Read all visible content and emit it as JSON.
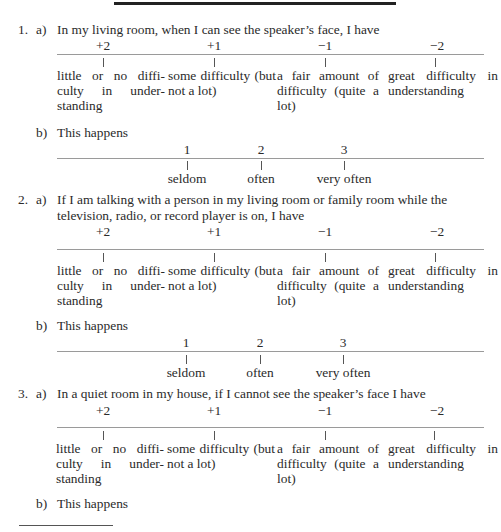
{
  "difficulty_scale": {
    "values": [
      "+2",
      "+1",
      "−1",
      "−2"
    ],
    "labels": [
      "little or no diffi- culty in under- standing",
      "some difficulty (but not a lot)",
      "a fair amount of difficulty (quite a lot)",
      "great difficulty in understanding"
    ]
  },
  "frequency_scale": {
    "values": [
      "1",
      "2",
      "3"
    ],
    "labels": [
      "seldom",
      "often",
      "very often"
    ]
  },
  "items": [
    {
      "number": "1.",
      "part_a_marker": "a)",
      "part_a_lines": [
        "In my living room, when I can see the speaker’s face, I have"
      ],
      "part_b_marker": "b)",
      "part_b_text": "This happens"
    },
    {
      "number": "2.",
      "part_a_marker": "a)",
      "part_a_lines": [
        "If I am talking with a person in my living room or family room while the",
        "television, radio, or record player is on, I have"
      ],
      "part_b_marker": "b)",
      "part_b_text": "This happens"
    },
    {
      "number": "3.",
      "part_a_marker": "a)",
      "part_a_lines": [
        "In a quiet room in my house, if I cannot see the speaker’s face I have"
      ],
      "part_b_marker": "b)",
      "part_b_text": "This happens"
    }
  ]
}
